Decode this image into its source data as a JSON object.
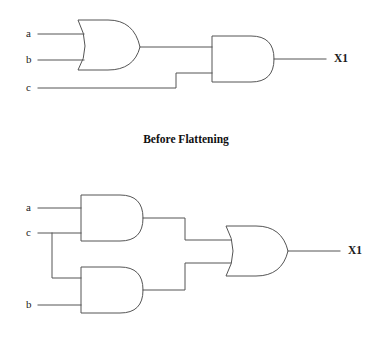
{
  "figure": {
    "caption": "Before Flattening",
    "background_color": "#ffffff",
    "line_color": "#555555",
    "text_color": "#1a1a1a"
  },
  "circuits": [
    {
      "id": "before-flattening",
      "expression": "X1 = (a + b) . c",
      "inputs": [
        {
          "label": "a"
        },
        {
          "label": "b"
        },
        {
          "label": "c"
        }
      ],
      "outputs": [
        {
          "label": "X1"
        }
      ],
      "gates": [
        {
          "type": "or",
          "name": "or-gate-1"
        },
        {
          "type": "and",
          "name": "and-gate-1"
        }
      ]
    },
    {
      "id": "after-flattening",
      "expression": "X1 = (a . c) + (b . c)",
      "inputs": [
        {
          "label": "a"
        },
        {
          "label": "c"
        },
        {
          "label": "b"
        }
      ],
      "outputs": [
        {
          "label": "X1"
        }
      ],
      "gates": [
        {
          "type": "and",
          "name": "and-gate-2"
        },
        {
          "type": "and",
          "name": "and-gate-3"
        },
        {
          "type": "or",
          "name": "or-gate-2"
        }
      ]
    }
  ]
}
